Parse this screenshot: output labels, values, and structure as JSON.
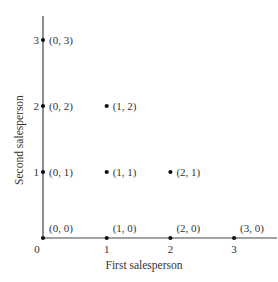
{
  "chart_data": {
    "type": "scatter",
    "title": "",
    "xlabel": "First salesperson",
    "ylabel": "Second salesperson",
    "xlim": [
      0,
      3.6
    ],
    "ylim": [
      0,
      3.35
    ],
    "x_ticks": [
      "0",
      "1",
      "2",
      "3"
    ],
    "y_ticks": [
      "1",
      "2",
      "3"
    ],
    "origin_label": "0",
    "grid": false,
    "legend": null,
    "points": [
      {
        "x": 0,
        "y": 0,
        "label": "(0, 0)"
      },
      {
        "x": 1,
        "y": 0,
        "label": "(1, 0)"
      },
      {
        "x": 2,
        "y": 0,
        "label": "(2, 0)"
      },
      {
        "x": 3,
        "y": 0,
        "label": "(3, 0)"
      },
      {
        "x": 0,
        "y": 1,
        "label": "(0, 1)"
      },
      {
        "x": 1,
        "y": 1,
        "label": "(1, 1)"
      },
      {
        "x": 2,
        "y": 1,
        "label": "(2, 1)"
      },
      {
        "x": 0,
        "y": 2,
        "label": "(0, 2)"
      },
      {
        "x": 1,
        "y": 2,
        "label": "(1, 2)"
      },
      {
        "x": 0,
        "y": 3,
        "label": "(0, 3)"
      }
    ],
    "colors": {
      "axis": "#333333",
      "point": "#111111",
      "text": "#333333"
    }
  }
}
